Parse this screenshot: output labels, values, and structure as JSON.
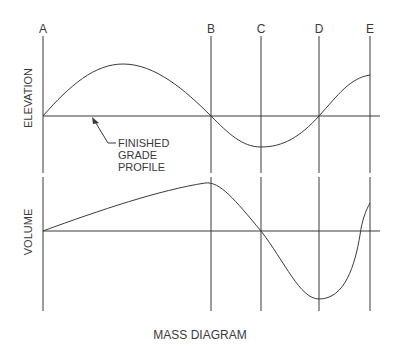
{
  "title": "MASS DIAGRAM",
  "station_labels": [
    "A",
    "B",
    "C",
    "D",
    "E"
  ],
  "upper_panel": {
    "axis_label": "ELEVATION",
    "annotation": [
      "FINISHED",
      "GRADE",
      "PROFILE"
    ]
  },
  "lower_panel": {
    "axis_label": "VOLUME"
  },
  "colors": {
    "line": "#3a3a3a",
    "background": "#ffffff"
  }
}
